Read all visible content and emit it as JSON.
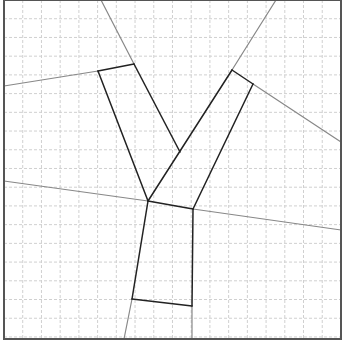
{
  "diagram": {
    "width": 345,
    "height": 351,
    "frame": {
      "x": 4,
      "y": 0,
      "w": 337,
      "h": 339,
      "stroke": "#555555",
      "stroke_width": 2
    },
    "grid": {
      "spacing": 18.72,
      "origin_x": 4,
      "origin_y": 0,
      "stroke": "#d0d0d0",
      "dash": "3,2"
    },
    "colors": {
      "shape": "#222222",
      "extension": "#888888"
    },
    "shape_segments": [
      {
        "name": "left-arm-top-edge",
        "x1": 98,
        "y1": 71,
        "x2": 134,
        "y2": 64
      },
      {
        "name": "left-arm-outer-edge",
        "x1": 98,
        "y1": 71,
        "x2": 148,
        "y2": 201
      },
      {
        "name": "left-arm-inner-edge",
        "x1": 134,
        "y1": 64,
        "x2": 180,
        "y2": 152
      },
      {
        "name": "right-arm-top-edge",
        "x1": 232,
        "y1": 70,
        "x2": 253,
        "y2": 84
      },
      {
        "name": "right-arm-outer-edge",
        "x1": 232,
        "y1": 70,
        "x2": 148,
        "y2": 201
      },
      {
        "name": "right-arm-inner-edge",
        "x1": 253,
        "y1": 84,
        "x2": 193,
        "y2": 209
      },
      {
        "name": "stem-top-edge",
        "x1": 148,
        "y1": 201,
        "x2": 193,
        "y2": 209
      },
      {
        "name": "stem-left-edge",
        "x1": 148,
        "y1": 201,
        "x2": 132,
        "y2": 299
      },
      {
        "name": "stem-right-edge",
        "x1": 193,
        "y1": 209,
        "x2": 192,
        "y2": 306
      },
      {
        "name": "stem-bottom-edge",
        "x1": 132,
        "y1": 299,
        "x2": 192,
        "y2": 306
      }
    ],
    "extension_lines": [
      {
        "name": "left-arm-top-extension",
        "x1": 4,
        "y1": 86,
        "x2": 98,
        "y2": 71
      },
      {
        "name": "left-arm-outer-extension-top",
        "x1": 101,
        "y1": 0,
        "x2": 134,
        "y2": 64
      },
      {
        "name": "right-arm-outer-extension-top",
        "x1": 276,
        "y1": 0,
        "x2": 232,
        "y2": 70
      },
      {
        "name": "right-arm-top-extension",
        "x1": 253,
        "y1": 84,
        "x2": 341,
        "y2": 142
      },
      {
        "name": "stem-top-extension-left",
        "x1": 4,
        "y1": 181,
        "x2": 148,
        "y2": 201
      },
      {
        "name": "stem-top-extension-right",
        "x1": 193,
        "y1": 209,
        "x2": 341,
        "y2": 230
      },
      {
        "name": "stem-left-extension-bottom",
        "x1": 132,
        "y1": 299,
        "x2": 124,
        "y2": 339
      },
      {
        "name": "stem-right-extension-bottom",
        "x1": 192,
        "y1": 306,
        "x2": 192,
        "y2": 339
      }
    ]
  }
}
